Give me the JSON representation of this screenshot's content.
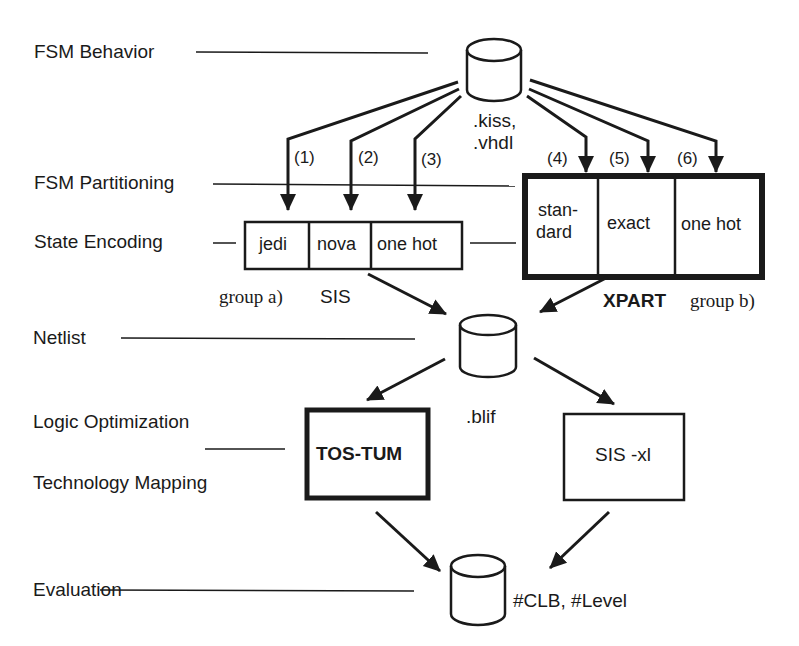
{
  "stages": [
    {
      "id": "fsm-behavior",
      "label": "FSM Behavior"
    },
    {
      "id": "fsm-partitioning",
      "label": "FSM Partitioning"
    },
    {
      "id": "state-encoding",
      "label": "State Encoding"
    },
    {
      "id": "netlist",
      "label": "Netlist"
    },
    {
      "id": "logic-optimization",
      "label": "Logic Optimization"
    },
    {
      "id": "technology-mapping",
      "label": "Technology Mapping"
    },
    {
      "id": "evaluation",
      "label": "Evaluation"
    }
  ],
  "databases": {
    "source": {
      "line1": ".kiss,",
      "line2": ".vhdl"
    },
    "netlist": {
      "label": ".blif"
    },
    "result": {
      "label": "#CLB, #Level"
    }
  },
  "paths": [
    "(1)",
    "(2)",
    "(3)",
    "(4)",
    "(5)",
    "(6)"
  ],
  "group_a": {
    "cells": [
      "jedi",
      "nova",
      "one hot"
    ],
    "caption": "group a)",
    "tool": "SIS"
  },
  "group_b": {
    "cells": [
      "stan-",
      "dard",
      "exact",
      "one hot"
    ],
    "tool": "XPART",
    "caption": "group b)"
  },
  "optimizers": {
    "left": "TOS-TUM",
    "right": "SIS -xl"
  }
}
